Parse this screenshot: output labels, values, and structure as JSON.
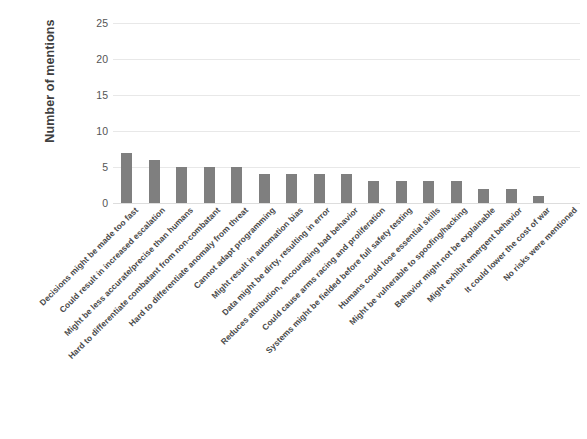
{
  "chart_data": {
    "type": "bar",
    "title": "",
    "xlabel": "",
    "ylabel": "Number of mentions",
    "ylim": [
      0,
      25
    ],
    "ytick_values": [
      0,
      5,
      10,
      15,
      20,
      25
    ],
    "ytick_labels": [
      "0",
      "5",
      "10",
      "15",
      "20",
      "25"
    ],
    "grid": true,
    "legend": false,
    "bar_color": "#7f7f7f",
    "categories": [
      "Decisions might be made too fast",
      "Could result in increased escalation",
      "Might be less accurate/precise than humans",
      "Hard to differentiate combatant from non-combatant",
      "Hard to differentiate anomaly from threat",
      "Cannot adapt programming",
      "Might result in automation bias",
      "Data might be dirty, resulting in error",
      "Reduces attribution, encouraging bad behavior",
      "Could cause arms racing and proliferation",
      "Systems might be fielded before full safety testing",
      "Humans could lose essential skills",
      "Might be vulnerable to spoofing/hacking",
      "Behavior might not be explainable",
      "Might exhibit emergent behavior",
      "It could lower the cost of war",
      "No risks were mentioned"
    ],
    "values": [
      7,
      6,
      5,
      5,
      5,
      4,
      4,
      4,
      4,
      3,
      3,
      3,
      3,
      2,
      2,
      1,
      0
    ]
  }
}
